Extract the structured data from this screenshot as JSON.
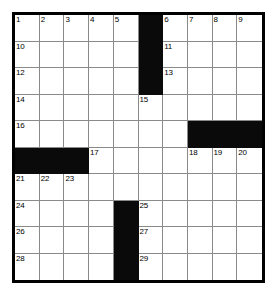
{
  "puzzle": {
    "type": "crossword-grid",
    "title": "Crossword Puzzle Grid",
    "columns": 10,
    "rows": 10,
    "colors": {
      "block": "#0a0a0a",
      "open": "#ffffff",
      "gridline": "#8a8a8a",
      "border": "#000000",
      "number_text": "#000000"
    },
    "cells": [
      {
        "r": 0,
        "c": 0,
        "block": false,
        "number": "1"
      },
      {
        "r": 0,
        "c": 1,
        "block": false,
        "number": "2"
      },
      {
        "r": 0,
        "c": 2,
        "block": false,
        "number": "3"
      },
      {
        "r": 0,
        "c": 3,
        "block": false,
        "number": "4"
      },
      {
        "r": 0,
        "c": 4,
        "block": false,
        "number": "5"
      },
      {
        "r": 0,
        "c": 5,
        "block": true,
        "number": ""
      },
      {
        "r": 0,
        "c": 6,
        "block": false,
        "number": "6"
      },
      {
        "r": 0,
        "c": 7,
        "block": false,
        "number": "7"
      },
      {
        "r": 0,
        "c": 8,
        "block": false,
        "number": "8"
      },
      {
        "r": 0,
        "c": 9,
        "block": false,
        "number": "9"
      },
      {
        "r": 1,
        "c": 0,
        "block": false,
        "number": "10"
      },
      {
        "r": 1,
        "c": 1,
        "block": false,
        "number": ""
      },
      {
        "r": 1,
        "c": 2,
        "block": false,
        "number": ""
      },
      {
        "r": 1,
        "c": 3,
        "block": false,
        "number": ""
      },
      {
        "r": 1,
        "c": 4,
        "block": false,
        "number": ""
      },
      {
        "r": 1,
        "c": 5,
        "block": true,
        "number": ""
      },
      {
        "r": 1,
        "c": 6,
        "block": false,
        "number": "11"
      },
      {
        "r": 1,
        "c": 7,
        "block": false,
        "number": ""
      },
      {
        "r": 1,
        "c": 8,
        "block": false,
        "number": ""
      },
      {
        "r": 1,
        "c": 9,
        "block": false,
        "number": ""
      },
      {
        "r": 2,
        "c": 0,
        "block": false,
        "number": "12"
      },
      {
        "r": 2,
        "c": 1,
        "block": false,
        "number": ""
      },
      {
        "r": 2,
        "c": 2,
        "block": false,
        "number": ""
      },
      {
        "r": 2,
        "c": 3,
        "block": false,
        "number": ""
      },
      {
        "r": 2,
        "c": 4,
        "block": false,
        "number": ""
      },
      {
        "r": 2,
        "c": 5,
        "block": true,
        "number": ""
      },
      {
        "r": 2,
        "c": 6,
        "block": false,
        "number": "13"
      },
      {
        "r": 2,
        "c": 7,
        "block": false,
        "number": ""
      },
      {
        "r": 2,
        "c": 8,
        "block": false,
        "number": ""
      },
      {
        "r": 2,
        "c": 9,
        "block": false,
        "number": ""
      },
      {
        "r": 3,
        "c": 0,
        "block": false,
        "number": "14"
      },
      {
        "r": 3,
        "c": 1,
        "block": false,
        "number": ""
      },
      {
        "r": 3,
        "c": 2,
        "block": false,
        "number": ""
      },
      {
        "r": 3,
        "c": 3,
        "block": false,
        "number": ""
      },
      {
        "r": 3,
        "c": 4,
        "block": false,
        "number": ""
      },
      {
        "r": 3,
        "c": 5,
        "block": false,
        "number": "15"
      },
      {
        "r": 3,
        "c": 6,
        "block": false,
        "number": ""
      },
      {
        "r": 3,
        "c": 7,
        "block": false,
        "number": ""
      },
      {
        "r": 3,
        "c": 8,
        "block": false,
        "number": ""
      },
      {
        "r": 3,
        "c": 9,
        "block": false,
        "number": ""
      },
      {
        "r": 4,
        "c": 0,
        "block": false,
        "number": "16"
      },
      {
        "r": 4,
        "c": 1,
        "block": false,
        "number": ""
      },
      {
        "r": 4,
        "c": 2,
        "block": false,
        "number": ""
      },
      {
        "r": 4,
        "c": 3,
        "block": false,
        "number": ""
      },
      {
        "r": 4,
        "c": 4,
        "block": false,
        "number": ""
      },
      {
        "r": 4,
        "c": 5,
        "block": false,
        "number": ""
      },
      {
        "r": 4,
        "c": 6,
        "block": false,
        "number": ""
      },
      {
        "r": 4,
        "c": 7,
        "block": true,
        "number": ""
      },
      {
        "r": 4,
        "c": 8,
        "block": true,
        "number": ""
      },
      {
        "r": 4,
        "c": 9,
        "block": true,
        "number": ""
      },
      {
        "r": 5,
        "c": 0,
        "block": true,
        "number": ""
      },
      {
        "r": 5,
        "c": 1,
        "block": true,
        "number": ""
      },
      {
        "r": 5,
        "c": 2,
        "block": true,
        "number": ""
      },
      {
        "r": 5,
        "c": 3,
        "block": false,
        "number": "17"
      },
      {
        "r": 5,
        "c": 4,
        "block": false,
        "number": ""
      },
      {
        "r": 5,
        "c": 5,
        "block": false,
        "number": ""
      },
      {
        "r": 5,
        "c": 6,
        "block": false,
        "number": ""
      },
      {
        "r": 5,
        "c": 7,
        "block": false,
        "number": "18"
      },
      {
        "r": 5,
        "c": 8,
        "block": false,
        "number": "19"
      },
      {
        "r": 5,
        "c": 9,
        "block": false,
        "number": "20"
      },
      {
        "r": 6,
        "c": 0,
        "block": false,
        "number": "21"
      },
      {
        "r": 6,
        "c": 1,
        "block": false,
        "number": "22"
      },
      {
        "r": 6,
        "c": 2,
        "block": false,
        "number": "23"
      },
      {
        "r": 6,
        "c": 3,
        "block": false,
        "number": ""
      },
      {
        "r": 6,
        "c": 4,
        "block": false,
        "number": ""
      },
      {
        "r": 6,
        "c": 5,
        "block": false,
        "number": ""
      },
      {
        "r": 6,
        "c": 6,
        "block": false,
        "number": ""
      },
      {
        "r": 6,
        "c": 7,
        "block": false,
        "number": ""
      },
      {
        "r": 6,
        "c": 8,
        "block": false,
        "number": ""
      },
      {
        "r": 6,
        "c": 9,
        "block": false,
        "number": ""
      },
      {
        "r": 7,
        "c": 0,
        "block": false,
        "number": "24"
      },
      {
        "r": 7,
        "c": 1,
        "block": false,
        "number": ""
      },
      {
        "r": 7,
        "c": 2,
        "block": false,
        "number": ""
      },
      {
        "r": 7,
        "c": 3,
        "block": false,
        "number": ""
      },
      {
        "r": 7,
        "c": 4,
        "block": true,
        "number": ""
      },
      {
        "r": 7,
        "c": 5,
        "block": false,
        "number": "25"
      },
      {
        "r": 7,
        "c": 6,
        "block": false,
        "number": ""
      },
      {
        "r": 7,
        "c": 7,
        "block": false,
        "number": ""
      },
      {
        "r": 7,
        "c": 8,
        "block": false,
        "number": ""
      },
      {
        "r": 7,
        "c": 9,
        "block": false,
        "number": ""
      },
      {
        "r": 8,
        "c": 0,
        "block": false,
        "number": "26"
      },
      {
        "r": 8,
        "c": 1,
        "block": false,
        "number": ""
      },
      {
        "r": 8,
        "c": 2,
        "block": false,
        "number": ""
      },
      {
        "r": 8,
        "c": 3,
        "block": false,
        "number": ""
      },
      {
        "r": 8,
        "c": 4,
        "block": true,
        "number": ""
      },
      {
        "r": 8,
        "c": 5,
        "block": false,
        "number": "27"
      },
      {
        "r": 8,
        "c": 6,
        "block": false,
        "number": ""
      },
      {
        "r": 8,
        "c": 7,
        "block": false,
        "number": ""
      },
      {
        "r": 8,
        "c": 8,
        "block": false,
        "number": ""
      },
      {
        "r": 8,
        "c": 9,
        "block": false,
        "number": ""
      },
      {
        "r": 9,
        "c": 0,
        "block": false,
        "number": "28"
      },
      {
        "r": 9,
        "c": 1,
        "block": false,
        "number": ""
      },
      {
        "r": 9,
        "c": 2,
        "block": false,
        "number": ""
      },
      {
        "r": 9,
        "c": 3,
        "block": false,
        "number": ""
      },
      {
        "r": 9,
        "c": 4,
        "block": true,
        "number": ""
      },
      {
        "r": 9,
        "c": 5,
        "block": false,
        "number": "29"
      },
      {
        "r": 9,
        "c": 6,
        "block": false,
        "number": ""
      },
      {
        "r": 9,
        "c": 7,
        "block": false,
        "number": ""
      },
      {
        "r": 9,
        "c": 8,
        "block": false,
        "number": ""
      },
      {
        "r": 9,
        "c": 9,
        "block": false,
        "number": ""
      }
    ]
  }
}
